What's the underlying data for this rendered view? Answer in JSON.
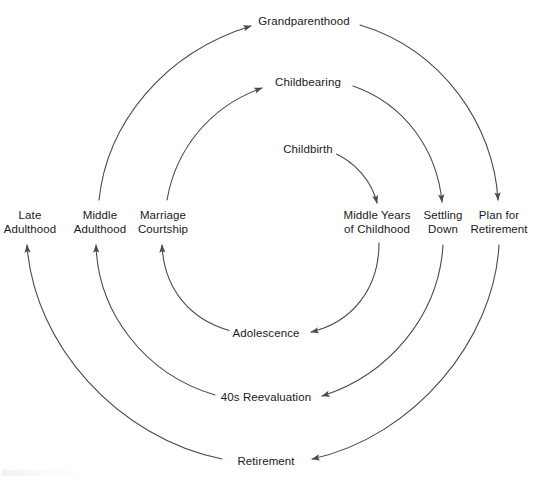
{
  "diagram": {
    "type": "spiral-cycle",
    "geometry": {
      "width": 543,
      "height": 480,
      "center_x": 270,
      "center_y": 228,
      "stroke_color": "#4a4a50",
      "stroke_width": 1.1,
      "text_color": "#1a1a1a"
    },
    "nodes": [
      {
        "id": "childbirth",
        "label": "Childbirth",
        "lines": [
          "Childbirth"
        ],
        "x": 308,
        "y": 150
      },
      {
        "id": "middle-childhood",
        "label": "Middle Years of Childhood",
        "lines": [
          "Middle Years",
          "of Childhood"
        ],
        "x": 377,
        "y": 222
      },
      {
        "id": "adolescence",
        "label": "Adolescence",
        "lines": [
          "Adolescence"
        ],
        "x": 266,
        "y": 334
      },
      {
        "id": "marriage",
        "label": "Marriage Courtship",
        "lines": [
          "Marriage",
          "Courtship"
        ],
        "x": 163,
        "y": 222
      },
      {
        "id": "childbearing",
        "label": "Childbearing",
        "lines": [
          "Childbearing"
        ],
        "x": 308,
        "y": 83
      },
      {
        "id": "settling-down",
        "label": "Settling Down",
        "lines": [
          "Settling",
          "Down"
        ],
        "x": 443,
        "y": 222
      },
      {
        "id": "40s-reevaluation",
        "label": "40s Reevaluation",
        "lines": [
          "40s Reevaluation"
        ],
        "x": 266,
        "y": 398
      },
      {
        "id": "middle-adulthood",
        "label": "Middle Adulthood",
        "lines": [
          "Middle",
          "Adulthood"
        ],
        "x": 100,
        "y": 222
      },
      {
        "id": "grandparenthood",
        "label": "Grandparenthood",
        "lines": [
          "Grandparenthood"
        ],
        "x": 304,
        "y": 22
      },
      {
        "id": "plan-retirement",
        "label": "Plan for Retirement",
        "lines": [
          "Plan for",
          "Retirement"
        ],
        "x": 499,
        "y": 222
      },
      {
        "id": "retirement",
        "label": "Retirement",
        "lines": [
          "Retirement"
        ],
        "x": 266,
        "y": 462
      },
      {
        "id": "late-adulthood",
        "label": "Late Adulthood",
        "lines": [
          "Late",
          "Adulthood"
        ],
        "x": 30,
        "y": 222
      }
    ],
    "flow_order": [
      "Childbirth",
      "Middle Years of Childhood",
      "Adolescence",
      "Marriage Courtship",
      "Childbearing",
      "Settling Down",
      "40s Reevaluation",
      "Middle Adulthood",
      "Grandparenthood",
      "Plan for Retirement",
      "Retirement",
      "Late Adulthood"
    ]
  }
}
